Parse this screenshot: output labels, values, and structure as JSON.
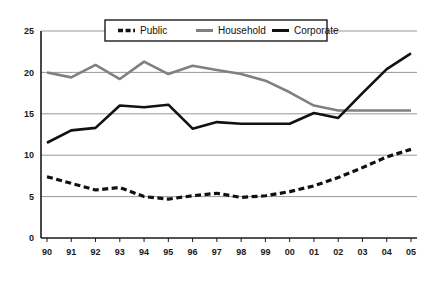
{
  "chart_data": {
    "type": "line",
    "title": "",
    "subtitle": "",
    "xlabel": "",
    "ylabel": "",
    "xlim": [
      0,
      15
    ],
    "ylim": [
      0,
      25
    ],
    "yticks": [
      0,
      5,
      10,
      15,
      20,
      25
    ],
    "ytick_labels": [
      "0",
      "5",
      "10",
      "15",
      "20",
      "25"
    ],
    "grid": true,
    "grid_axis": "y",
    "legend_position": "top-center",
    "categories": [
      "90",
      "91",
      "92",
      "93",
      "94",
      "95",
      "96",
      "97",
      "98",
      "99",
      "00",
      "01",
      "02",
      "03",
      "04",
      "05"
    ],
    "series": [
      {
        "name": "Public",
        "style": "dashed",
        "color": "#111111",
        "values": [
          7.4,
          6.6,
          5.8,
          6.1,
          5.0,
          4.7,
          5.1,
          5.4,
          4.9,
          5.1,
          5.6,
          6.3,
          7.3,
          8.5,
          9.8,
          10.7
        ]
      },
      {
        "name": "Household",
        "style": "solid",
        "color": "#808080",
        "values": [
          20.0,
          19.4,
          20.9,
          19.2,
          21.3,
          19.8,
          20.8,
          20.3,
          19.8,
          19.0,
          17.6,
          16.0,
          15.4,
          15.4,
          15.4,
          15.4
        ]
      },
      {
        "name": "Corporate",
        "style": "solid",
        "color": "#111111",
        "values": [
          11.5,
          13.0,
          13.3,
          16.0,
          15.8,
          16.1,
          13.2,
          14.0,
          13.8,
          13.8,
          13.8,
          15.1,
          14.5,
          17.5,
          20.4,
          22.3
        ]
      }
    ]
  },
  "legend": {
    "items": [
      {
        "label": "Public",
        "swatch": "dashed-black-line-swatch"
      },
      {
        "label": "Household",
        "swatch": "solid-gray-line-swatch"
      },
      {
        "label": "Corporate",
        "swatch": "solid-black-line-swatch"
      }
    ]
  },
  "axes": {
    "x_tick_labels": [
      "90",
      "91",
      "92",
      "93",
      "94",
      "95",
      "96",
      "97",
      "98",
      "99",
      "00",
      "01",
      "02",
      "03",
      "04",
      "05"
    ],
    "y_tick_labels": [
      "25",
      "20",
      "15",
      "10",
      "5",
      "0"
    ]
  },
  "colors": {
    "gridline": "#8c8c8c",
    "axis": "#1a1a1a",
    "series_gray": "#808080",
    "series_black": "#111111",
    "background": "#ffffff"
  }
}
